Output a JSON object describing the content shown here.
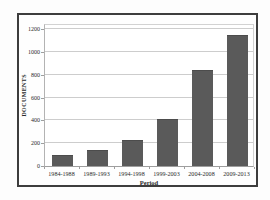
{
  "chart_data": {
    "type": "bar",
    "title": "",
    "xlabel": "Period",
    "ylabel": "DOCUMENTS",
    "categories": [
      "1984-1988",
      "1989-1993",
      "1994-1998",
      "1999-2003",
      "2004-2008",
      "2009-2013"
    ],
    "values": [
      90,
      130,
      220,
      400,
      830,
      1140
    ],
    "ylim": [
      0,
      1200
    ],
    "yticks": [
      0,
      200,
      400,
      600,
      800,
      1000,
      1200
    ],
    "grid": true,
    "legend_position": "none",
    "colors": {
      "bar_fill": "#5a5a5a",
      "bar_edge": "#4c4c4c",
      "gridline": "#cdcdcd",
      "axis_line": "#9e9e9e",
      "frame_border": "#3d3d3d",
      "text": "#2a2a2a"
    }
  }
}
